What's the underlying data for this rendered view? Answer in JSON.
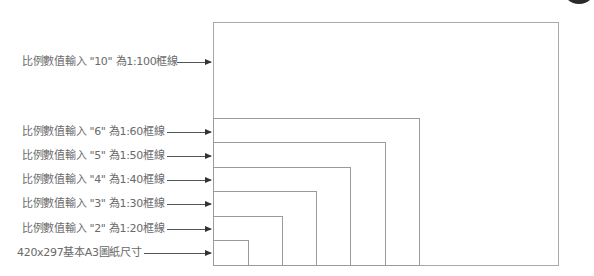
{
  "diagram": {
    "title": "",
    "labels": [
      {
        "id": "scale-100",
        "text": "比例數值輸入 \"10\" 為1:100框線",
        "y": 62
      },
      {
        "id": "scale-60",
        "text": "比例數值輸入 \"6\" 為1:60框線",
        "y": 132
      },
      {
        "id": "scale-50",
        "text": "比例數值輸入 \"5\" 為1:50框線",
        "y": 156
      },
      {
        "id": "scale-40",
        "text": "比例數值輸入 \"4\" 為1:40框線",
        "y": 180
      },
      {
        "id": "scale-30",
        "text": "比例數值輸入 \"3\" 為1:30框線",
        "y": 204
      },
      {
        "id": "scale-20",
        "text": "比例數值輸入 \"2\" 為1:20框線",
        "y": 229
      },
      {
        "id": "a3-base",
        "text": "420x297基本A3圖紙尺寸",
        "y": 253
      }
    ],
    "frames": [
      {
        "id": "frame-1-100",
        "scale": "1:100",
        "left": 213,
        "top": 22,
        "right": 558,
        "bottom": 265
      },
      {
        "id": "frame-1-60",
        "scale": "1:60",
        "left": 213,
        "top": 118,
        "right": 419,
        "bottom": 265
      },
      {
        "id": "frame-1-50",
        "scale": "1:50",
        "left": 213,
        "top": 142,
        "right": 385,
        "bottom": 265
      },
      {
        "id": "frame-1-40",
        "scale": "1:40",
        "left": 213,
        "top": 167,
        "right": 350,
        "bottom": 265
      },
      {
        "id": "frame-1-30",
        "scale": "1:30",
        "left": 213,
        "top": 191,
        "right": 316,
        "bottom": 265
      },
      {
        "id": "frame-1-20",
        "scale": "1:20",
        "left": 213,
        "top": 216,
        "right": 282,
        "bottom": 265
      },
      {
        "id": "frame-a3",
        "scale": "A3",
        "left": 213,
        "top": 240,
        "right": 248,
        "bottom": 265
      }
    ],
    "colors": {
      "text": "#6a6a6a",
      "frame": "#9a9a9a",
      "arrow": "#333333"
    }
  }
}
